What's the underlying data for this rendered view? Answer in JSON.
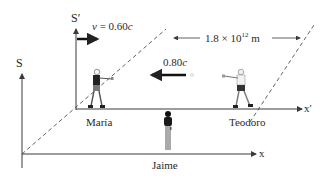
{
  "frames": {
    "s": {
      "label": "S",
      "x_axis_label": "x"
    },
    "s_prime": {
      "label": "S′",
      "x_axis_label": "x′"
    }
  },
  "velocity": {
    "var": "v",
    "eq": " = 0.60",
    "unit": "c"
  },
  "distance": {
    "base": "1.8 × 10",
    "exp": "12",
    "unit": " m"
  },
  "speed_signal": {
    "value": "0.80",
    "unit": "c"
  },
  "people": {
    "maria": "María",
    "teodoro": "Teodoro",
    "jaime": "Jaime"
  },
  "colors": {
    "line": "#3a3a3a",
    "text": "#2a2a2a",
    "background": "#ffffff"
  }
}
